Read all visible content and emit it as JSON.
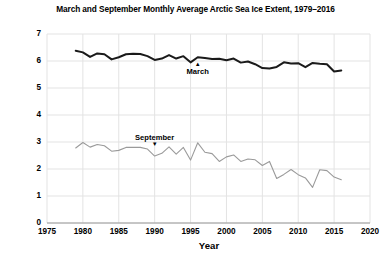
{
  "chart_data": {
    "type": "line",
    "title": "March and September Monthly Average Arctic Sea Ice Extent, 1979–2016",
    "xlabel": "Year",
    "ylabel": "Sea ice extent (million square miles)",
    "xlim": [
      1975,
      2020
    ],
    "ylim": [
      0,
      7
    ],
    "grid": true,
    "legend_position": "inline-annotations",
    "x_ticks": [
      "1975",
      "1980",
      "1985",
      "1990",
      "1995",
      "2000",
      "2005",
      "2010",
      "2015",
      "2020"
    ],
    "x_tick_values": [
      1975,
      1980,
      1985,
      1990,
      1995,
      2000,
      2005,
      2010,
      2015,
      2020
    ],
    "y_ticks": [
      "0",
      "1",
      "2",
      "3",
      "4",
      "5",
      "6",
      "7"
    ],
    "y_tick_values": [
      0,
      1,
      2,
      3,
      4,
      5,
      6,
      7
    ],
    "x": [
      1979,
      1980,
      1981,
      1982,
      1983,
      1984,
      1985,
      1986,
      1987,
      1988,
      1989,
      1990,
      1991,
      1992,
      1993,
      1994,
      1995,
      1996,
      1997,
      1998,
      1999,
      2000,
      2001,
      2002,
      2003,
      2004,
      2005,
      2006,
      2007,
      2008,
      2009,
      2010,
      2011,
      2012,
      2013,
      2014,
      2015,
      2016
    ],
    "series": [
      {
        "name": "March",
        "color": "#1a1a1a",
        "width": 2.0,
        "annotation": "March",
        "annotation_caret": "▲",
        "annotation_caret_position": "above-label",
        "annotation_x": 1996,
        "values": [
          6.38,
          6.32,
          6.15,
          6.28,
          6.25,
          6.06,
          6.14,
          6.25,
          6.27,
          6.26,
          6.18,
          6.04,
          6.09,
          6.22,
          6.09,
          6.18,
          5.95,
          6.14,
          6.11,
          6.07,
          6.08,
          6.03,
          6.09,
          5.94,
          5.98,
          5.88,
          5.74,
          5.72,
          5.78,
          5.95,
          5.91,
          5.92,
          5.77,
          5.93,
          5.9,
          5.88,
          5.61,
          5.65
        ]
      },
      {
        "name": "September",
        "color": "#9a9a9a",
        "width": 1.1,
        "annotation": "September",
        "annotation_caret": "▼",
        "annotation_caret_position": "below-label",
        "annotation_x": 1990,
        "values": [
          2.78,
          2.98,
          2.81,
          2.91,
          2.86,
          2.66,
          2.69,
          2.8,
          2.8,
          2.8,
          2.74,
          2.48,
          2.58,
          2.82,
          2.55,
          2.8,
          2.33,
          2.97,
          2.62,
          2.57,
          2.28,
          2.45,
          2.52,
          2.28,
          2.37,
          2.34,
          2.13,
          2.28,
          1.65,
          1.8,
          1.98,
          1.79,
          1.67,
          1.32,
          1.97,
          1.94,
          1.7,
          1.6
        ]
      }
    ]
  }
}
